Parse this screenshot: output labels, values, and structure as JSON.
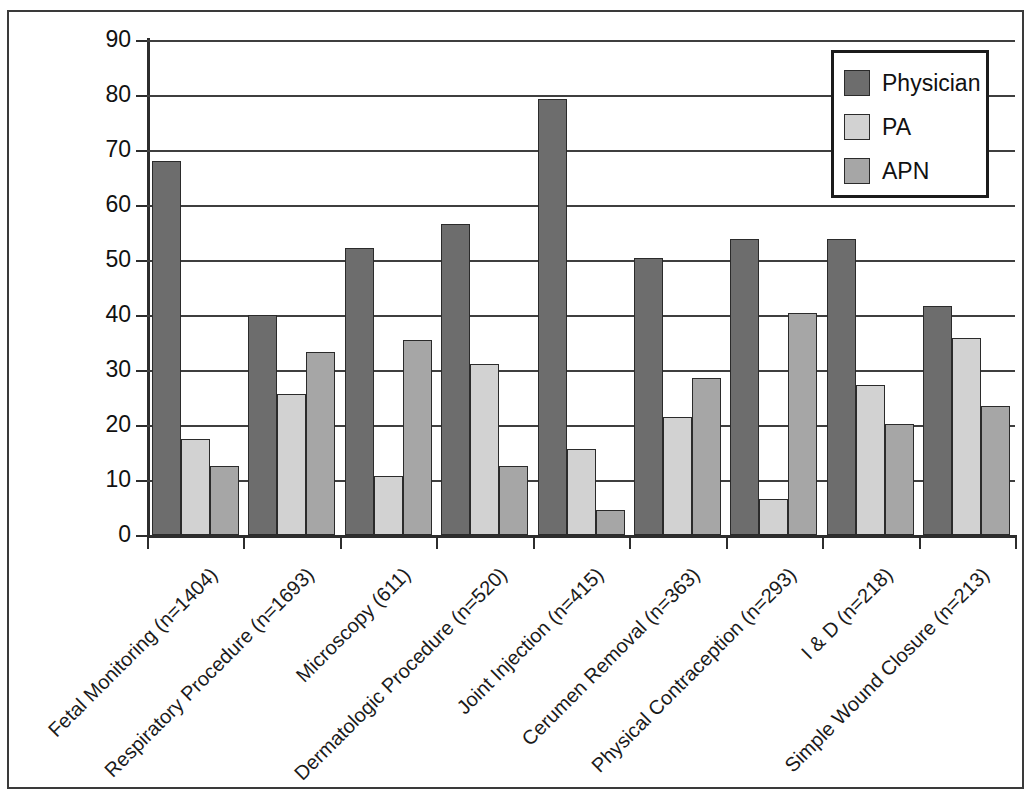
{
  "chart_data": {
    "type": "bar",
    "title": "",
    "subtitle": "",
    "xlabel": "",
    "ylabel": "",
    "ylim": [
      0,
      90
    ],
    "yticks": [
      0,
      10,
      20,
      30,
      40,
      50,
      60,
      70,
      80,
      90
    ],
    "grid": true,
    "legend_position": "top-right",
    "categories": [
      "Fetal Monitoring (n=1404)",
      "Respiratory Procedure (n=1693)",
      "Microscopy (611)",
      "Dermatologic Procedure (n=520)",
      "Joint Injection (n=415)",
      "Cerumen Removal (n=363)",
      "Physical Contraception (n=293)",
      "I & D (n=218)",
      "Simple Wound Closure (n=213)"
    ],
    "series": [
      {
        "name": "Physician",
        "color": "#6d6d6d",
        "values": [
          68.0,
          40.0,
          52.2,
          56.6,
          79.2,
          50.3,
          53.8,
          53.8,
          41.6
        ]
      },
      {
        "name": "PA",
        "color": "#d2d2d2",
        "values": [
          17.5,
          25.6,
          10.7,
          31.1,
          15.7,
          21.4,
          6.5,
          27.2,
          35.8
        ]
      },
      {
        "name": "APN",
        "color": "#a6a6a6",
        "values": [
          12.5,
          33.3,
          35.4,
          12.6,
          4.5,
          28.5,
          40.3,
          20.2,
          23.4
        ]
      }
    ]
  },
  "styling": {
    "frame_color": "#3a3a3a",
    "axis_color": "#2d2d2d",
    "grid_color": "#3f3f3f",
    "bar_outline": "#2b2b2b",
    "background": "#ffffff"
  }
}
